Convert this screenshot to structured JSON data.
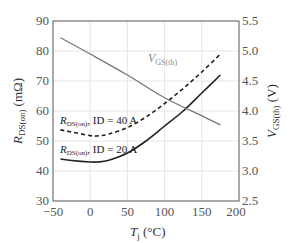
{
  "chart_data": {
    "type": "line",
    "title": "",
    "xlabel": "T_j (°C)",
    "ylabel": "R_DS(on) (mΩ)",
    "y2label": "V_GS(th) (V)",
    "xlim": [
      -50,
      200
    ],
    "ylim": [
      30,
      90
    ],
    "y2lim": [
      2.5,
      5.5
    ],
    "grid": true,
    "x_ticks": [
      "−50",
      "0",
      "50",
      "100",
      "150",
      "200"
    ],
    "y_ticks": [
      "30",
      "40",
      "50",
      "60",
      "70",
      "80",
      "90"
    ],
    "y2_ticks": [
      "2.5",
      "3.0",
      "3.5",
      "4.0",
      "4.5",
      "5.0",
      "5.5"
    ],
    "series": [
      {
        "name": "R_DS(on), ID = 40 A",
        "axis": "left",
        "style": "dashed",
        "color": "#222222",
        "x": [
          -40,
          -25,
          0,
          10,
          25,
          50,
          75,
          100,
          125,
          150,
          175
        ],
        "y": [
          53.7,
          53.0,
          51.8,
          51.7,
          52.3,
          54.5,
          58.0,
          62.5,
          67.5,
          73.0,
          79.0
        ]
      },
      {
        "name": "R_DS(on), ID = 20 A",
        "axis": "left",
        "style": "solid",
        "color": "#222222",
        "x": [
          -40,
          -25,
          0,
          10,
          25,
          50,
          75,
          100,
          125,
          150,
          175
        ],
        "y": [
          44.0,
          43.5,
          43.0,
          43.0,
          43.6,
          46.0,
          50.0,
          55.0,
          60.0,
          66.0,
          72.0
        ]
      },
      {
        "name": "V_GS(th)",
        "axis": "right",
        "style": "solid",
        "color": "#777777",
        "x": [
          -40,
          0,
          50,
          100,
          150,
          175
        ],
        "y": [
          5.22,
          4.95,
          4.6,
          4.22,
          3.92,
          3.77
        ]
      }
    ],
    "annotations": [
      {
        "text_main": "V",
        "text_sub": "GS(th)",
        "near": "V_GS(th) curve"
      },
      {
        "text_main": "R",
        "text_sub": "DS(on)",
        "text_rest": ", ID = 40 A"
      },
      {
        "text_main": "R",
        "text_sub": "DS(on)",
        "text_rest": ", ID = 20 A"
      }
    ]
  },
  "labels": {
    "x_main": "T",
    "x_sub": "j",
    "x_unit": " (°C)",
    "y_main": "R",
    "y_sub": "DS(on)",
    "y_unit": " (mΩ)",
    "y2_main": "V",
    "y2_sub": "GS(th)",
    "y2_unit": " (V)",
    "vgs_main": "V",
    "vgs_sub": "GS(th)",
    "r40_main": "R",
    "r40_sub": "DS(on)",
    "r40_rest": ", ID = 40 A",
    "r20_main": "R",
    "r20_sub": "DS(on)",
    "r20_rest": ", ID = 20 A"
  }
}
